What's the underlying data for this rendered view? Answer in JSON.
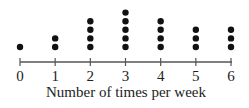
{
  "chart_data": {
    "type": "dot",
    "title": "",
    "xlabel": "Number of times per week",
    "ylabel": "",
    "categories": [
      "0",
      "1",
      "2",
      "3",
      "4",
      "5",
      "6"
    ],
    "x": [
      0,
      1,
      2,
      3,
      4,
      5,
      6
    ],
    "values": [
      1,
      2,
      4,
      5,
      4,
      3,
      3
    ],
    "xlim": [
      0,
      6
    ],
    "grid": false,
    "legend": null
  },
  "colors": {
    "dot": "#111111",
    "axis": "#555555",
    "text": "#222222"
  }
}
